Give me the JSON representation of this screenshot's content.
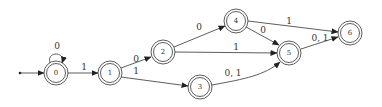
{
  "diagram": {
    "type": "finite-automaton",
    "start_state": "0",
    "states": [
      {
        "id": "0",
        "label": "0",
        "x": 56,
        "y": 73,
        "accepting": true
      },
      {
        "id": "1",
        "label": "1",
        "x": 110,
        "y": 73,
        "accepting": true
      },
      {
        "id": "2",
        "label": "2",
        "x": 163,
        "y": 52,
        "accepting": true
      },
      {
        "id": "3",
        "label": "3",
        "x": 200,
        "y": 87,
        "accepting": true
      },
      {
        "id": "4",
        "label": "4",
        "x": 236,
        "y": 21,
        "accepting": true
      },
      {
        "id": "5",
        "label": "5",
        "x": 289,
        "y": 53,
        "accepting": true
      },
      {
        "id": "6",
        "label": "6",
        "x": 350,
        "y": 33,
        "accepting": true
      }
    ],
    "transitions": [
      {
        "from": "0",
        "to": "0",
        "label": "0"
      },
      {
        "from": "0",
        "to": "1",
        "label": "1"
      },
      {
        "from": "1",
        "to": "2",
        "label": "0"
      },
      {
        "from": "1",
        "to": "3",
        "label": "1"
      },
      {
        "from": "2",
        "to": "4",
        "label": "0"
      },
      {
        "from": "2",
        "to": "5",
        "label": "1"
      },
      {
        "from": "3",
        "to": "5",
        "label": "0, 1"
      },
      {
        "from": "4",
        "to": "5",
        "label": "0"
      },
      {
        "from": "4",
        "to": "6",
        "label": "1"
      },
      {
        "from": "5",
        "to": "6",
        "label": "0, 1"
      }
    ]
  }
}
